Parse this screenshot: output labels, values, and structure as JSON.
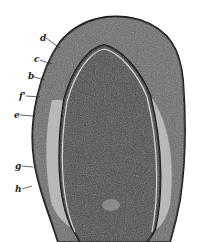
{
  "figure": {
    "colors": {
      "outer": "#5a5a5a",
      "outline": "#1a1a1a",
      "light_band": "#b8b8b8",
      "inner": "#4a4a4a",
      "thin_line": "#d8d8d8"
    },
    "labels": [
      {
        "text": "d",
        "x": 40,
        "y": 34
      },
      {
        "text": "c",
        "x": 34,
        "y": 55
      },
      {
        "text": "b",
        "x": 28,
        "y": 72
      },
      {
        "text": "f'",
        "x": 19,
        "y": 92
      },
      {
        "text": "e",
        "x": 14,
        "y": 111
      },
      {
        "text": "g",
        "x": 15,
        "y": 162
      },
      {
        "text": "h",
        "x": 15,
        "y": 185
      }
    ]
  }
}
